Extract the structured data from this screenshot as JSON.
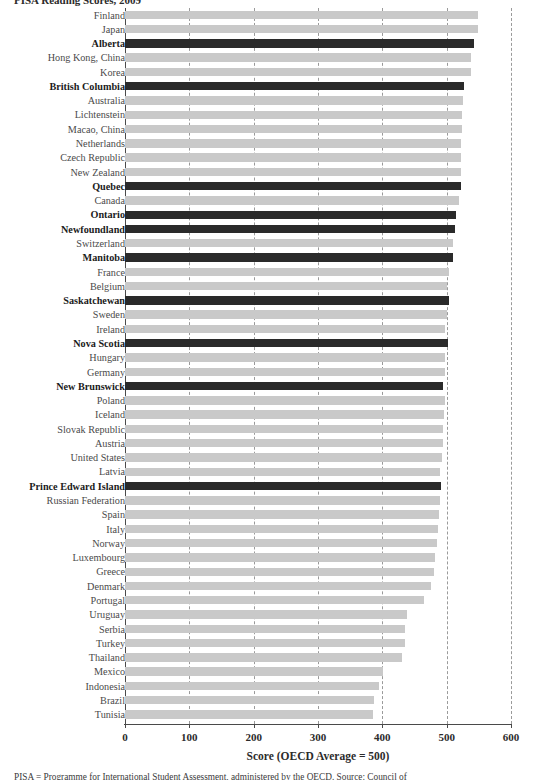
{
  "figure": {
    "top_clipped_text": "PISA Reading Scores, 2009",
    "bottom_clipped_note": "PISA = Programme for International Student Assessment, administered by the OECD. Source: Council of"
  },
  "axis": {
    "x_title": "Score (OECD Average = 500)",
    "ticks": [
      0,
      100,
      200,
      300,
      400,
      500,
      600
    ],
    "tick_labels": [
      "0",
      "100",
      "200",
      "300",
      "400",
      "500",
      "600"
    ],
    "gridlines": [
      100,
      200,
      300,
      400,
      500,
      600
    ],
    "xmin": 0,
    "xmax": 600
  },
  "colors": {
    "bar_default": "#c9c9c9",
    "bar_highlight": "#2a2a2a",
    "grid": "#9a9a9a",
    "axis": "#4a4a4a",
    "label": "#4a4a4a",
    "label_highlight": "#1b1b1b"
  },
  "chart_data": {
    "type": "bar",
    "orientation": "horizontal",
    "title": "PISA Reading Scores, 2009",
    "xlabel": "Score (OECD Average = 500)",
    "ylabel": "",
    "xlim": [
      0,
      600
    ],
    "grid": true,
    "legend": "none",
    "highlight_note": "Bold black bars are Canadian provinces; grey bars are countries/economies",
    "categories": [
      "Finland",
      "Japan",
      "Alberta",
      "Hong Kong, China",
      "Korea",
      "British Columbia",
      "Australia",
      "Lichtenstein",
      "Macao, China",
      "Netherlands",
      "Czech Republic",
      "New Zealand",
      "Quebec",
      "Canada",
      "Ontario",
      "Newfoundland",
      "Switzerland",
      "Manitoba",
      "France",
      "Belgium",
      "Saskatchewan",
      "Sweden",
      "Ireland",
      "Nova Scotia",
      "Hungary",
      "Germany",
      "New Brunswick",
      "Poland",
      "Iceland",
      "Slovak Republic",
      "Austria",
      "United States",
      "Latvia",
      "Prince Edward Island",
      "Russian Federation",
      "Spain",
      "Italy",
      "Norway",
      "Luxembourg",
      "Greece",
      "Denmark",
      "Portugal",
      "Uruguay",
      "Serbia",
      "Turkey",
      "Thailand",
      "Mexico",
      "Indonesia",
      "Brazil",
      "Tunisia"
    ],
    "values": [
      549,
      549,
      543,
      538,
      538,
      527,
      525,
      524,
      524,
      523,
      522,
      522,
      522,
      519,
      515,
      513,
      510,
      510,
      503,
      501,
      504,
      500,
      498,
      502,
      498,
      497,
      495,
      498,
      496,
      495,
      494,
      493,
      490,
      491,
      489,
      488,
      487,
      485,
      482,
      481,
      476,
      465,
      438,
      435,
      435,
      431,
      401,
      395,
      387,
      385
    ],
    "highlighted": [
      "Alberta",
      "British Columbia",
      "Quebec",
      "Ontario",
      "Newfoundland",
      "Manitoba",
      "Saskatchewan",
      "Nova Scotia",
      "New Brunswick",
      "Prince Edward Island"
    ]
  }
}
